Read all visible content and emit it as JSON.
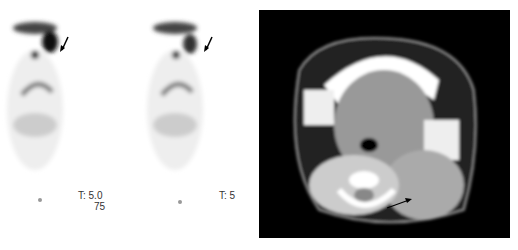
{
  "figure": {
    "panels": [
      {
        "id": "pet-mip-1",
        "type": "PET coronal MIP",
        "labels": {
          "line1": "T: 5.0",
          "line2": "75"
        },
        "annotation": "arrow pointing to hypermetabolic lesion"
      },
      {
        "id": "pet-mip-2",
        "type": "PET coronal MIP",
        "labels": {
          "line1": "T: 5",
          "line2": ""
        },
        "annotation": "arrow pointing to lesion with reduced uptake"
      },
      {
        "id": "ct-axial",
        "type": "CT axial",
        "annotation": "arrow pointing to soft tissue mass"
      }
    ],
    "colors": {
      "pet_bg": "#ffffff",
      "ct_bg": "#000000",
      "arrow": "#000000"
    }
  }
}
